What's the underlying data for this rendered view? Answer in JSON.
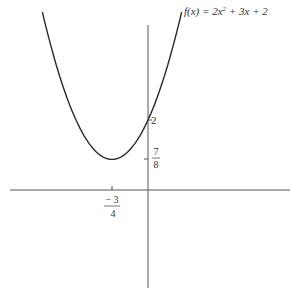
{
  "chart_data": {
    "type": "line",
    "function": "f(x) = 2x^2 + 3x + 2",
    "xlabel": "",
    "ylabel": "",
    "series": [
      {
        "name": "f(x) = 2x² + 3x + 2",
        "x": [
          -2.2,
          -2.0,
          -1.75,
          -1.5,
          -1.25,
          -1.0,
          -0.75,
          -0.5,
          -0.25,
          0.0,
          0.25,
          0.5,
          0.7
        ],
        "y": [
          5.08,
          4.0,
          2.875,
          2.0,
          1.375,
          1.0,
          0.875,
          1.0,
          1.375,
          2.0,
          2.875,
          4.0,
          5.08
        ]
      }
    ],
    "annotations": [
      {
        "axis": "x",
        "value": -0.75,
        "label_num": "− 3",
        "label_den": "4"
      },
      {
        "axis": "y",
        "value": 2,
        "label": "2"
      },
      {
        "axis": "y",
        "value": 0.875,
        "label_num": "7",
        "label_den": "8"
      }
    ],
    "xlim": [
      -2.86,
      2.96
    ],
    "ylim": [
      -2.8,
      5.4
    ],
    "grid": false,
    "legend": "none"
  },
  "labels": {
    "func": "f(x) = 2x",
    "func_sup": "2",
    "func_rest": " + 3x + 2",
    "y2": "2",
    "y78_num": "7",
    "y78_den": "8",
    "x34_num": "− 3",
    "x34_den": "4"
  },
  "colors": {
    "curve": "#2a2a2a",
    "axis": "#555555"
  }
}
